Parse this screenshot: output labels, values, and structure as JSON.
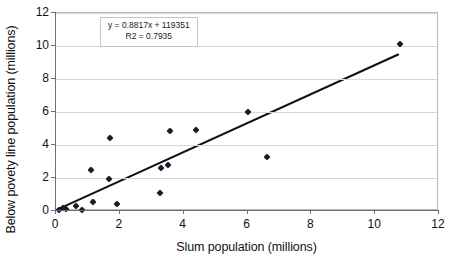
{
  "chart_data": {
    "type": "scatter",
    "title": "",
    "xlabel": "Slum population (millions)",
    "ylabel": "Below povety line population (millions)",
    "xlim": [
      0,
      12
    ],
    "ylim": [
      0,
      12
    ],
    "xticks": [
      0,
      2,
      4,
      6,
      8,
      10,
      12
    ],
    "yticks": [
      0,
      2,
      4,
      6,
      8,
      10,
      12
    ],
    "xtick_labels": [
      "0",
      "2",
      "4",
      "6",
      "8",
      "10",
      "12"
    ],
    "ytick_labels": [
      "0",
      "2",
      "4",
      "6",
      "8",
      "10",
      "12"
    ],
    "grid": "horizontal",
    "legend": "none",
    "marker": "diamond",
    "marker_color": "#1a1a2e",
    "trendline_color": "#111111",
    "points": [
      {
        "x": 0.1,
        "y": 0.05
      },
      {
        "x": 0.22,
        "y": 0.18
      },
      {
        "x": 0.3,
        "y": 0.1
      },
      {
        "x": 0.62,
        "y": 0.28
      },
      {
        "x": 0.8,
        "y": 0.04
      },
      {
        "x": 1.1,
        "y": 2.5
      },
      {
        "x": 1.15,
        "y": 0.55
      },
      {
        "x": 1.65,
        "y": 1.95
      },
      {
        "x": 1.7,
        "y": 4.4
      },
      {
        "x": 1.9,
        "y": 0.42
      },
      {
        "x": 3.25,
        "y": 1.12
      },
      {
        "x": 3.3,
        "y": 2.62
      },
      {
        "x": 3.52,
        "y": 2.78
      },
      {
        "x": 3.56,
        "y": 4.86
      },
      {
        "x": 4.38,
        "y": 4.92
      },
      {
        "x": 6.03,
        "y": 6.03
      },
      {
        "x": 6.6,
        "y": 3.28
      },
      {
        "x": 10.78,
        "y": 10.12
      }
    ],
    "trendline": {
      "x_start": 0.05,
      "y_start": 0.1,
      "x_end": 10.72,
      "y_end": 9.48
    },
    "annotations": {
      "equation": "y = 0.8817x + 119351",
      "r_squared": "R2 = 0.7935"
    }
  }
}
